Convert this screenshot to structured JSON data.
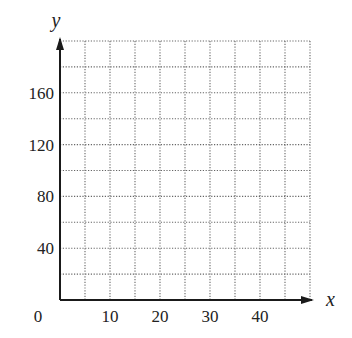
{
  "chart_data": {
    "type": "line",
    "title": "",
    "xlabel": "x",
    "ylabel": "y",
    "xlim": [
      0,
      50
    ],
    "ylim": [
      0,
      200
    ],
    "x_ticks": [
      0,
      10,
      20,
      30,
      40
    ],
    "y_ticks": [
      40,
      80,
      120,
      160
    ],
    "x_tick_labels": [
      "0",
      "10",
      "20",
      "30",
      "40"
    ],
    "y_tick_labels": [
      "40",
      "80",
      "120",
      "160"
    ],
    "grid": true,
    "grid_style": "dotted",
    "grid_x_step": 5,
    "grid_y_step": 20,
    "series": [],
    "legend": null
  },
  "colors": {
    "axis": "#1a1a1a",
    "grid": "#666666",
    "text": "#222222",
    "background": "#ffffff"
  }
}
